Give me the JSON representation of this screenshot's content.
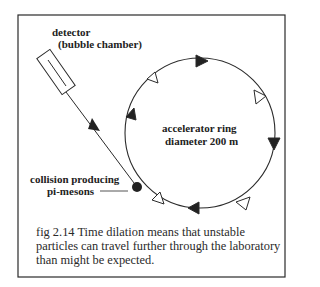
{
  "figure": {
    "labels": {
      "detector_line1": "detector",
      "detector_line2": "(bubble chamber)",
      "ring_line1": "accelerator ring",
      "ring_line2": "diameter 200 m",
      "collision_line1": "collision producing",
      "collision_line2": "pi-mesons"
    },
    "caption": "fig 2.14  Time dilation means that unstable particles can travel further through the laboratory than might be expected.",
    "ring": {
      "cx": 200,
      "cy": 133,
      "r": 75
    },
    "colors": {
      "stroke": "#2a2a2a",
      "background": "#ffffff"
    }
  }
}
